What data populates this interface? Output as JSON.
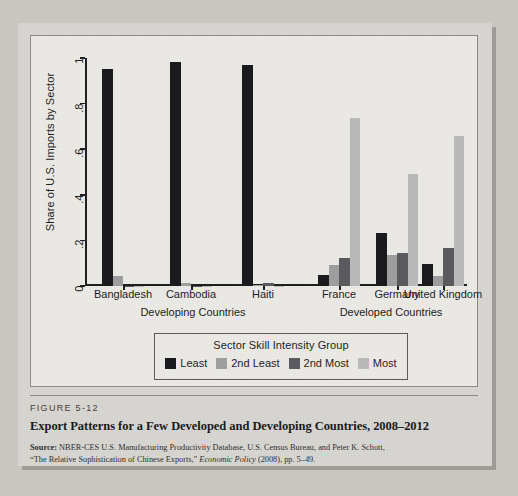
{
  "figure": {
    "number_label": "FIGURE 5-12",
    "title": "Export Patterns for a Few Developed and Developing Countries, 2008–2012",
    "source_prefix": "Source:",
    "source_line1": " NBER-CES U.S. Manufacturing Productivity Database, U.S. Census Bureau, and Peter K. Schott,",
    "source_line2_pre": "“The Relative Sophistication of Chinese Exports,” ",
    "source_line2_italic": "Economic Policy",
    "source_line2_post": " (2008), pp. 5–49."
  },
  "legend": {
    "title": "Sector Skill Intensity Group",
    "items": [
      {
        "label": "Least",
        "color": "#15151a"
      },
      {
        "label": "2nd Least",
        "color": "#9d9d9d"
      },
      {
        "label": "2nd Most",
        "color": "#58585c"
      },
      {
        "label": "Most",
        "color": "#b9b9b9"
      }
    ]
  },
  "chart_data": {
    "type": "bar",
    "title": "",
    "xlabel": "",
    "ylabel": "Share of U.S. Imports by Sector",
    "ylim": [
      0,
      1
    ],
    "ytick_values": [
      0,
      0.2,
      0.4,
      0.6,
      0.8,
      1
    ],
    "ytick_labels": [
      "0",
      ".2",
      ".4",
      ".6",
      ".8",
      "1"
    ],
    "grid": false,
    "legend_position": "below-plot",
    "categories": [
      "Bangladesh",
      "Cambodia",
      "Haiti",
      "France",
      "Germany",
      "United Kingdom"
    ],
    "group_labels": [
      {
        "label": "Developing Countries",
        "categories": [
          "Bangladesh",
          "Cambodia",
          "Haiti"
        ]
      },
      {
        "label": "Developed Countries",
        "categories": [
          "France",
          "Germany",
          "United Kingdom"
        ]
      }
    ],
    "series": [
      {
        "name": "Least",
        "color": "#15151a",
        "values": [
          0.95,
          0.983,
          0.968,
          0.05,
          0.232,
          0.095
        ]
      },
      {
        "name": "2nd Least",
        "color": "#9d9d9d",
        "values": [
          0.045,
          0.012,
          0.004,
          0.09,
          0.135,
          0.045
        ]
      },
      {
        "name": "2nd Most",
        "color": "#58585c",
        "values": [
          0.002,
          0.002,
          0.012,
          0.125,
          0.145,
          0.165
        ]
      },
      {
        "name": "Most",
        "color": "#b9b9b9",
        "values": [
          0.001,
          0.001,
          0.001,
          0.735,
          0.49,
          0.66
        ]
      }
    ]
  }
}
